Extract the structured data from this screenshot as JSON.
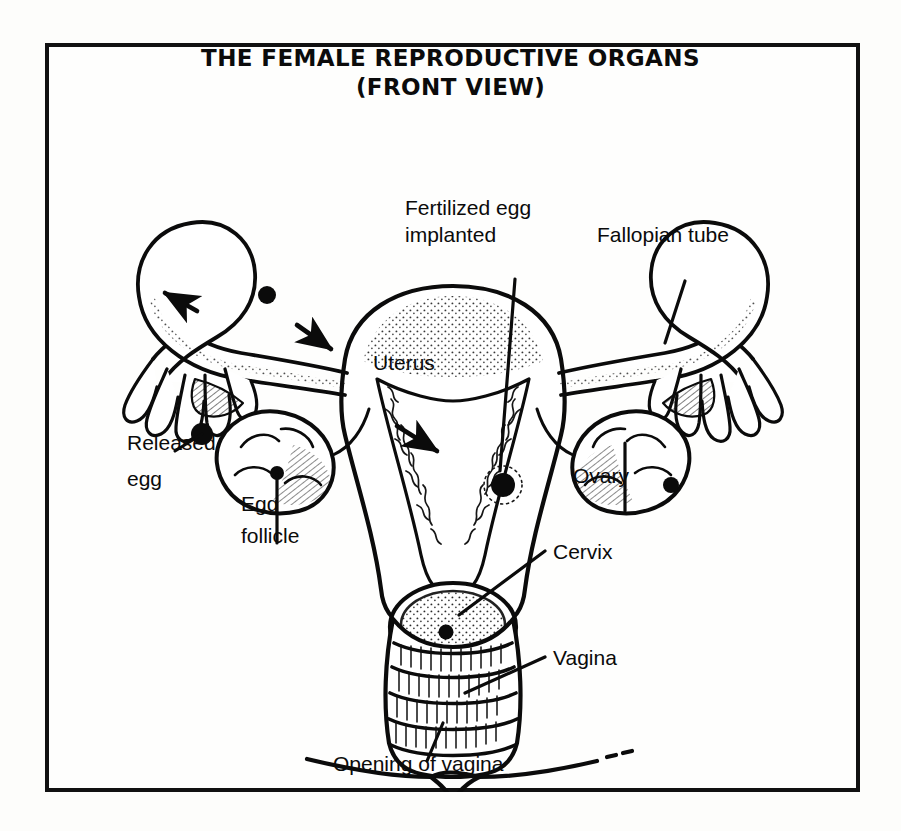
{
  "figure": {
    "title_line_1": "THE FEMALE REPRODUCTIVE ORGANS",
    "title_line_2": "(FRONT VIEW)",
    "view": "front view",
    "style": "black-and-white line drawing, pen-and-ink anatomical illustration",
    "border_color": "#111111",
    "background_color": "#fefefd",
    "ink_color": "#0b0b0b"
  },
  "labels": {
    "fertilized_egg": "Fertilized egg",
    "implanted": "implanted",
    "fallopian_tube": "Fallopian tube",
    "uterus": "Uterus",
    "released_egg_line1": "Released",
    "released_egg_line2": "egg",
    "egg_follicle_line1": "Egg",
    "egg_follicle_line2": "follicle",
    "ovary": "Ovary",
    "cervix": "Cervix",
    "vagina": "Vagina",
    "opening_of_vagina": "Opening of vagina"
  },
  "anatomy_parts": [
    "uterus",
    "left fallopian tube",
    "right fallopian tube",
    "left ovary",
    "right ovary",
    "fimbriae",
    "cervix",
    "vagina",
    "vaginal opening",
    "released egg",
    "egg follicle",
    "fertilized egg implanted in uterine wall"
  ],
  "annotations": {
    "arrow_count": 3,
    "arrow_meaning": "direction of egg travel from ovary through fallopian tube into uterus",
    "egg_markers": [
      "released egg at left fimbriae",
      "egg travelling in left fallopian tube",
      "fertilized egg implanted in uterine wall"
    ]
  }
}
